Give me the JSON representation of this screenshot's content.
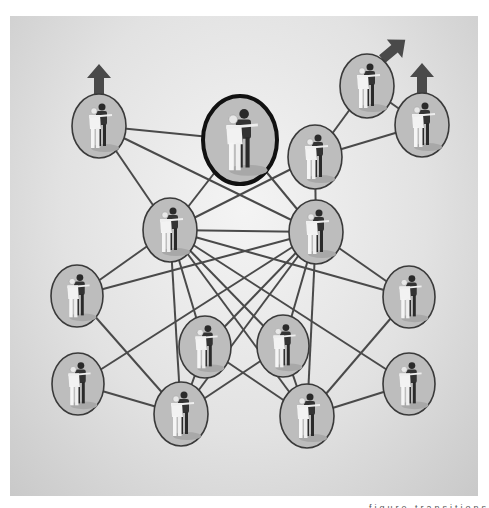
{
  "diagram": {
    "panel_color": "#d8d8d8",
    "edge_color": "#4a4a4a",
    "node_fill": "#bdbdbd",
    "node_stroke": "#3a3a3a",
    "arrow_color": "#4a4a4a",
    "highlighted_node": "n2",
    "nodes": [
      {
        "id": "n1",
        "label": "solo-turn-figure",
        "cx": 99,
        "cy": 126,
        "rx": 27,
        "ry": 32,
        "arrow": "up"
      },
      {
        "id": "n2",
        "label": "start-figure",
        "cx": 240,
        "cy": 140,
        "rx": 37,
        "ry": 44,
        "highlight": true
      },
      {
        "id": "n3",
        "label": "step-sideways-figure",
        "cx": 367,
        "cy": 86,
        "rx": 27,
        "ry": 32,
        "arrow": "up-right"
      },
      {
        "id": "n4",
        "label": "step-sideways-figure-2",
        "cx": 422,
        "cy": 125,
        "rx": 27,
        "ry": 32,
        "arrow": "up"
      },
      {
        "id": "n5",
        "label": "solo-figure",
        "cx": 315,
        "cy": 157,
        "rx": 27,
        "ry": 32
      },
      {
        "id": "n6",
        "label": "side-by-side-figure",
        "cx": 170,
        "cy": 230,
        "rx": 27,
        "ry": 32
      },
      {
        "id": "n7",
        "label": "side-by-side-figure-2",
        "cx": 316,
        "cy": 232,
        "rx": 27,
        "ry": 32
      },
      {
        "id": "n8",
        "label": "closed-hold-figure",
        "cx": 77,
        "cy": 296,
        "rx": 26,
        "ry": 31
      },
      {
        "id": "n9",
        "label": "closed-hold-figure-2",
        "cx": 409,
        "cy": 297,
        "rx": 26,
        "ry": 31
      },
      {
        "id": "n10",
        "label": "turn-figure",
        "cx": 205,
        "cy": 347,
        "rx": 26,
        "ry": 31
      },
      {
        "id": "n11",
        "label": "turn-figure-2",
        "cx": 283,
        "cy": 346,
        "rx": 26,
        "ry": 31
      },
      {
        "id": "n12",
        "label": "promenade-figure",
        "cx": 78,
        "cy": 384,
        "rx": 26,
        "ry": 31
      },
      {
        "id": "n13",
        "label": "promenade-figure-2",
        "cx": 409,
        "cy": 384,
        "rx": 26,
        "ry": 31
      },
      {
        "id": "n14",
        "label": "dip-figure",
        "cx": 181,
        "cy": 414,
        "rx": 27,
        "ry": 32
      },
      {
        "id": "n15",
        "label": "dip-figure-2",
        "cx": 307,
        "cy": 416,
        "rx": 27,
        "ry": 32
      }
    ],
    "edges": [
      [
        "n1",
        "n2"
      ],
      [
        "n1",
        "n6"
      ],
      [
        "n1",
        "n7"
      ],
      [
        "n2",
        "n6"
      ],
      [
        "n2",
        "n7"
      ],
      [
        "n5",
        "n3"
      ],
      [
        "n5",
        "n4"
      ],
      [
        "n5",
        "n6"
      ],
      [
        "n5",
        "n7"
      ],
      [
        "n3",
        "n4"
      ],
      [
        "n6",
        "n7"
      ],
      [
        "n6",
        "n8"
      ],
      [
        "n6",
        "n9"
      ],
      [
        "n6",
        "n10"
      ],
      [
        "n6",
        "n11"
      ],
      [
        "n6",
        "n14"
      ],
      [
        "n6",
        "n15"
      ],
      [
        "n7",
        "n8"
      ],
      [
        "n7",
        "n9"
      ],
      [
        "n7",
        "n10"
      ],
      [
        "n7",
        "n11"
      ],
      [
        "n7",
        "n14"
      ],
      [
        "n7",
        "n15"
      ],
      [
        "n7",
        "n12"
      ],
      [
        "n6",
        "n13"
      ],
      [
        "n8",
        "n14"
      ],
      [
        "n12",
        "n14"
      ],
      [
        "n9",
        "n15"
      ],
      [
        "n13",
        "n15"
      ],
      [
        "n10",
        "n14"
      ],
      [
        "n11",
        "n15"
      ],
      [
        "n10",
        "n15"
      ],
      [
        "n11",
        "n14"
      ]
    ]
  },
  "caption": {
    "text": "figure transitions"
  }
}
